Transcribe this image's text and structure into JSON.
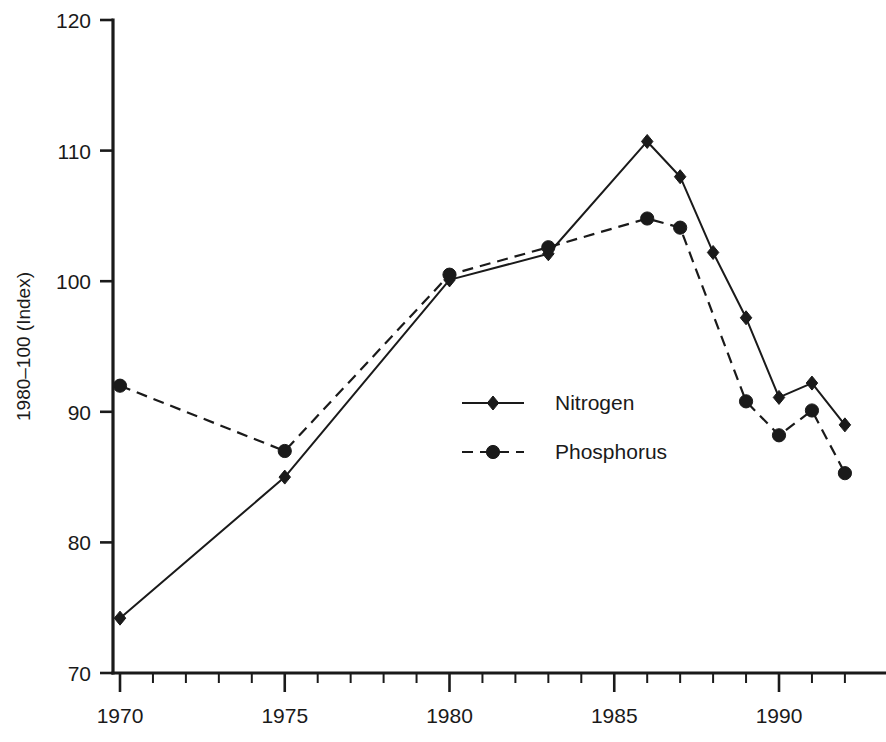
{
  "chart_data": {
    "type": "line",
    "title": "",
    "xlabel": "",
    "ylabel": "1980–100 (Index)",
    "xlim": [
      1969.0,
      1992.6
    ],
    "ylim": [
      70,
      120
    ],
    "grid": false,
    "legend_position": "center",
    "x_tick_labels": [
      "1970",
      "1975",
      "1980",
      "1985",
      "1990"
    ],
    "x_major_ticks": [
      1970,
      1975,
      1980,
      1985,
      1990
    ],
    "x_minor_ticks": [
      1971,
      1972,
      1973,
      1974,
      1976,
      1977,
      1978,
      1979,
      1981,
      1982,
      1983,
      1984,
      1986,
      1987,
      1988,
      1989,
      1991,
      1992
    ],
    "y_tick_labels": [
      "70",
      "80",
      "90",
      "100",
      "110",
      "120"
    ],
    "y_ticks": [
      70,
      80,
      90,
      100,
      110,
      120
    ],
    "series": [
      {
        "name": "Nitrogen",
        "marker": "diamond",
        "line_style": "solid",
        "color": "#1a1a1a",
        "x": [
          1970,
          1975,
          1980,
          1983,
          1986,
          1987,
          1988,
          1989,
          1990,
          1991,
          1992
        ],
        "values": [
          74.2,
          85.0,
          100.1,
          102.1,
          110.7,
          108.0,
          102.2,
          97.2,
          91.1,
          92.2,
          89.0
        ]
      },
      {
        "name": "Phosphorus",
        "marker": "circle",
        "line_style": "dashed",
        "color": "#1a1a1a",
        "x": [
          1970,
          1975,
          1980,
          1983,
          1986,
          1987,
          1989,
          1990,
          1991,
          1992
        ],
        "values": [
          92.0,
          87.0,
          100.5,
          102.6,
          104.8,
          104.1,
          90.8,
          88.2,
          90.1,
          85.3
        ]
      }
    ]
  },
  "legend": {
    "entries": [
      {
        "label": "Nitrogen",
        "marker": "diamond",
        "line_style": "solid"
      },
      {
        "label": "Phosphorus",
        "marker": "circle",
        "line_style": "dashed"
      }
    ]
  }
}
